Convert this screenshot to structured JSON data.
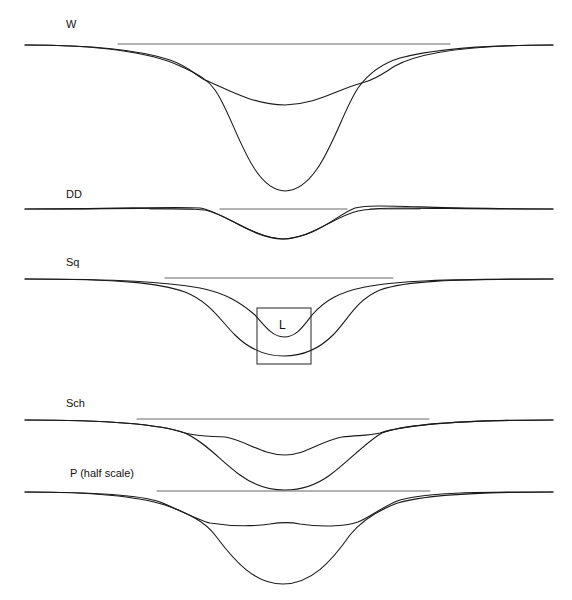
{
  "figure": {
    "panels": [
      {
        "id": "W",
        "label": "W",
        "label_pos": [
          66,
          18
        ],
        "baseline_y": 45,
        "axis_x": [
          25,
          553
        ],
        "reference_line": {
          "x1": 118,
          "x2": 450,
          "y": 44
        },
        "curves": [
          {
            "name": "shallow",
            "depth_y": 105,
            "center_x": 285,
            "width": 62,
            "shape": "broad"
          },
          {
            "name": "deep",
            "depth_y": 191,
            "center_x": 286,
            "width": 42,
            "shape": "narrow"
          }
        ]
      },
      {
        "id": "DD",
        "label": "DD",
        "label_pos": [
          66,
          188
        ],
        "baseline_y": 209,
        "axis_x": [
          25,
          553
        ],
        "reference_line_segments": [
          {
            "x1": 150,
            "x2": 193,
            "y": 209
          },
          {
            "x1": 220,
            "x2": 347,
            "y": 209
          },
          {
            "x1": 370,
            "x2": 420,
            "y": 209
          }
        ],
        "curves": [
          {
            "name": "a",
            "depth_y": 239,
            "center_x": 283,
            "width": 40
          },
          {
            "name": "b",
            "depth_y": 239,
            "center_x": 283,
            "width": 44
          }
        ]
      },
      {
        "id": "Sq",
        "label": "Sq",
        "label_pos": [
          66,
          256
        ],
        "baseline_y": 279,
        "axis_x": [
          25,
          553
        ],
        "reference_line": {
          "x1": 165,
          "x2": 393,
          "y": 278
        },
        "curves": [
          {
            "name": "inner",
            "depth_y": 337,
            "center_x": 284,
            "width": 28
          },
          {
            "name": "outer",
            "depth_y": 356,
            "center_x": 284,
            "width": 52
          }
        ],
        "inset_box": {
          "label": "L",
          "x": 257,
          "y": 308,
          "w": 54,
          "h": 56
        }
      },
      {
        "id": "Sch",
        "label": "Sch",
        "label_pos": [
          66,
          397
        ],
        "baseline_y": 420,
        "axis_x": [
          25,
          553
        ],
        "reference_line": {
          "x1": 137,
          "x2": 429,
          "y": 419
        },
        "curves": [
          {
            "name": "shallow",
            "depth_y": 455,
            "center_x": 285,
            "width": 38
          },
          {
            "name": "deep",
            "depth_y": 490,
            "center_x": 285,
            "width": 46
          }
        ]
      },
      {
        "id": "P",
        "label": "P (half scale)",
        "label_pos": [
          70,
          467
        ],
        "baseline_y": 492,
        "axis_x": [
          25,
          553
        ],
        "reference_line": {
          "x1": 157,
          "x2": 430,
          "y": 491
        },
        "curves": [
          {
            "name": "shallow",
            "depth_y": 526,
            "center_x": 283,
            "width": 70
          },
          {
            "name": "deep",
            "depth_y": 584,
            "center_x": 283,
            "width": 50
          }
        ]
      }
    ],
    "stroke_color": "#1a1a1a",
    "reference_color": "#555555"
  }
}
